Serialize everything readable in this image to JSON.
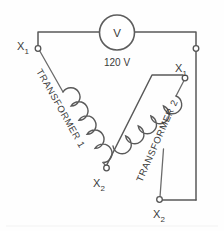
{
  "diagram": {
    "type": "electrical-schematic",
    "meter": {
      "symbol": "V",
      "symbol_name": "voltmeter-symbol",
      "reading_label": "120 V"
    },
    "terminals": [
      {
        "id": "t1-x1",
        "label": "X",
        "subscript": "1",
        "belongs_to": "Transformer 1",
        "position": "upper-left"
      },
      {
        "id": "t1-x2",
        "label": "X",
        "subscript": "2",
        "belongs_to": "Transformer 1",
        "position": "lower-middle"
      },
      {
        "id": "t2-x1",
        "label": "X",
        "subscript": "1",
        "belongs_to": "Transformer 2",
        "position": "middle-right"
      },
      {
        "id": "t2-x2",
        "label": "X",
        "subscript": "2",
        "belongs_to": "Transformer 2",
        "position": "bottom-right"
      }
    ],
    "transformers": [
      {
        "id": "xf1",
        "label": "TRANSFORMER 1",
        "coil_turns": 5
      },
      {
        "id": "xf2",
        "label": "TRANSFORMER 2",
        "coil_turns": 5
      }
    ],
    "colors": {
      "wire": "#595959",
      "coil": "#5a5a5a",
      "terminal_fill": "#ffffff",
      "text": "#3a3a3a",
      "background": "#fefefe"
    }
  }
}
